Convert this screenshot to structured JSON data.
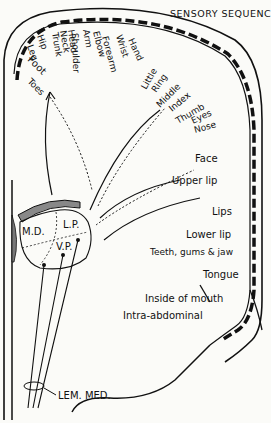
{
  "title": "SENSORY SEQUENCE",
  "top_labels": [
    "Hip",
    "Leg",
    "Trunk",
    "Neck",
    "Head",
    "Shoulder",
    "Arm",
    "Elbow",
    "Forearm",
    "Wrist",
    "Hand",
    "Little",
    "Ring",
    "Middle",
    "Index",
    "Thumb",
    "Eyes",
    "Nose"
  ],
  "left_labels": [
    "Foot",
    "Toes"
  ],
  "right_labels": [
    "Face",
    "Upper lip",
    "Lips",
    "Lower lip",
    "Teeth, gums & jaw",
    "Tongue",
    "Inside of mouth",
    "Intra-abdominal"
  ],
  "thalamus": {
    "md": "M.D.",
    "lp": "L.P.",
    "vp": "V.P."
  },
  "tract": "LEM. MED."
}
